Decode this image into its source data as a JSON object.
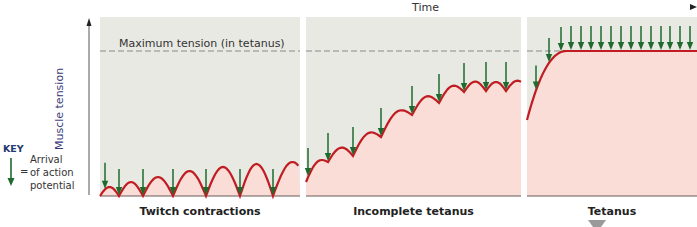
{
  "figure": {
    "time_axis_label": "Time",
    "y_axis_label": "Muscle tension",
    "max_tension_label": "Maximum tension (in tetanus)",
    "key": {
      "title": "KEY",
      "equals": "=",
      "description_lines": [
        "Arrival",
        "of action",
        "potential"
      ]
    },
    "panels": [
      {
        "title": "Twitch contractions",
        "x0": 100,
        "x1": 300
      },
      {
        "title": "Incomplete tetanus",
        "x0": 306,
        "x1": 521
      },
      {
        "title": "Tetanus",
        "x0": 527,
        "x1": 697
      }
    ],
    "colors": {
      "panel_bg": "#e8e9e2",
      "fill_under_curve": "#f9ddd6",
      "curve": "#c01c22",
      "arrow": "#1f6a2e",
      "dashed_line": "#8a8a8a",
      "axis": "#555555",
      "key_title": "#233a6e"
    }
  },
  "chart_data": {
    "type": "line",
    "xlabel": "Time",
    "ylabel": "Muscle tension",
    "max_tension_y_px": 51,
    "baseline_y_px": 196,
    "series": [
      {
        "name": "Twitch contractions",
        "arrows_x_px": [
          105,
          119,
          143,
          173,
          206,
          240,
          273
        ],
        "peaks_y_px": [
          187,
          182,
          177,
          171,
          167,
          164,
          162,
          161
        ]
      },
      {
        "name": "Incomplete tetanus",
        "arrows_x_px": [
          308,
          328,
          353,
          381,
          412,
          439,
          464,
          486,
          506
        ],
        "trough_y_px": [
          170,
          162,
          156,
          137,
          115,
          103,
          92,
          91,
          91
        ]
      },
      {
        "name": "Tetanus",
        "arrows_x_px": [
          536,
          549,
          561,
          571,
          581,
          591,
          601,
          611,
          621,
          631,
          641,
          651,
          661,
          670,
          680,
          690
        ],
        "plateau_y_px": 51
      }
    ]
  }
}
